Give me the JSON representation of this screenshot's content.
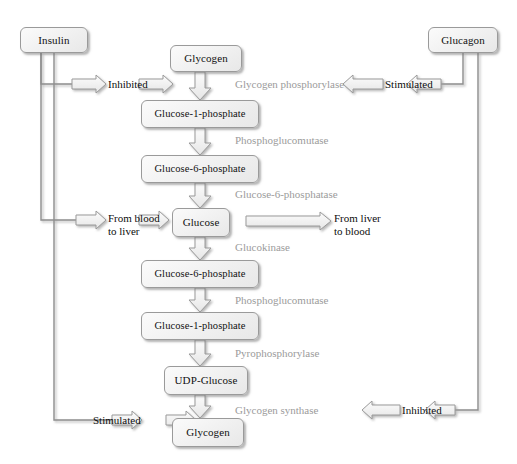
{
  "diagram": {
    "colors": {
      "node_fill": "#f1f1f1",
      "node_border": "#9a9a9a",
      "enzyme_text": "#9b9b9b",
      "label_text": "#0d0d0d",
      "line": "#8c8c8c",
      "background": "#ffffff"
    },
    "hormones": [
      {
        "id": "insulin",
        "label": "Insulin"
      },
      {
        "id": "glucagon",
        "label": "Glucagon"
      }
    ],
    "metabolites": [
      {
        "id": "glycogen-top",
        "label": "Glycogen"
      },
      {
        "id": "glucose-1-phosphate-top",
        "label": "Glucose-1-phosphate"
      },
      {
        "id": "glucose-6-phosphate-top",
        "label": "Glucose-6-phosphate"
      },
      {
        "id": "glucose",
        "label": "Glucose"
      },
      {
        "id": "glucose-6-phosphate-bottom",
        "label": "Glucose-6-phosphate"
      },
      {
        "id": "glucose-1-phosphate-bottom",
        "label": "Glucose-1-phosphate"
      },
      {
        "id": "udp-glucose",
        "label": "UDP-Glucose"
      },
      {
        "id": "glycogen-bottom",
        "label": "Glycogen"
      }
    ],
    "enzymes": [
      {
        "id": "glycogen-phosphorylase",
        "label": "Glycogen phosphorylase"
      },
      {
        "id": "phosphoglucomutase-top",
        "label": "Phosphoglucomutase"
      },
      {
        "id": "glucose-6-phosphatase",
        "label": "Glucose-6-phosphatase"
      },
      {
        "id": "glucokinase",
        "label": "Glucokinase"
      },
      {
        "id": "phosphoglucomutase-bottom",
        "label": "Phosphoglucomutase"
      },
      {
        "id": "pyrophosphorylase",
        "label": "Pyrophosphorylase"
      },
      {
        "id": "glycogen-synthase",
        "label": "Glycogen synthase"
      }
    ],
    "regulation": [
      {
        "id": "insulin-inhibits-phosphorylase",
        "label": "Inhibited",
        "source": "Insulin",
        "target": "Glycogen phosphorylase"
      },
      {
        "id": "glucagon-stimulates-phosphorylase",
        "label": "Stimulated",
        "source": "Glucagon",
        "target": "Glycogen phosphorylase"
      },
      {
        "id": "insulin-stimulates-synthase",
        "label": "Stimulated",
        "source": "Insulin",
        "target": "Glycogen synthase"
      },
      {
        "id": "glucagon-inhibits-synthase",
        "label": "Inhibited",
        "source": "Glucagon",
        "target": "Glycogen synthase"
      }
    ],
    "transport": [
      {
        "id": "from-blood-to-liver",
        "line1": "From blood",
        "line2": "to liver"
      },
      {
        "id": "from-liver-to-blood",
        "line1": "From liver",
        "line2": "to blood"
      }
    ]
  }
}
